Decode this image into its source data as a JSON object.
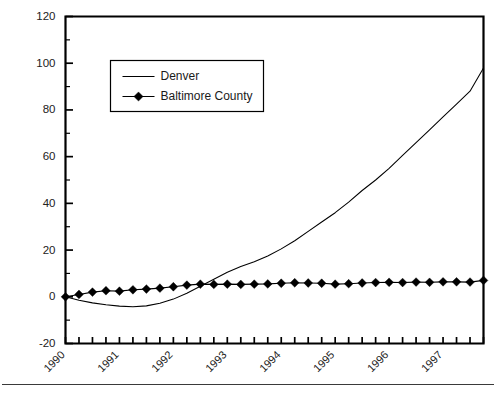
{
  "chart_data": {
    "type": "line",
    "title": "",
    "subtitle": "",
    "xlabel": "",
    "ylabel": "",
    "ylim": [
      -20,
      120
    ],
    "y_major_ticks": [
      -20,
      0,
      20,
      40,
      60,
      80,
      100,
      120
    ],
    "y_tick_labels": [
      "-20",
      "0",
      "20",
      "40",
      "60",
      "80",
      "100",
      "120"
    ],
    "y_minor_step": 10,
    "grid": false,
    "legend_position": "upper-left-inside",
    "x_axis_kind": "quarterly",
    "x_tick_count": 32,
    "x_year_labels": [
      "1990",
      "1991",
      "1992",
      "1993",
      "1994",
      "1995",
      "1996",
      "1997"
    ],
    "x": [
      "1990 Q1",
      "1990 Q2",
      "1990 Q3",
      "1990 Q4",
      "1991 Q1",
      "1991 Q2",
      "1991 Q3",
      "1991 Q4",
      "1992 Q1",
      "1992 Q2",
      "1992 Q3",
      "1992 Q4",
      "1993 Q1",
      "1993 Q2",
      "1993 Q3",
      "1993 Q4",
      "1994 Q1",
      "1994 Q2",
      "1994 Q3",
      "1994 Q4",
      "1995 Q1",
      "1995 Q2",
      "1995 Q3",
      "1995 Q4",
      "1996 Q1",
      "1996 Q2",
      "1996 Q3",
      "1996 Q4",
      "1997 Q1",
      "1997 Q2",
      "1997 Q3",
      "1997 Q4"
    ],
    "series": [
      {
        "name": "Denver",
        "marker": "none",
        "color": "#000000",
        "values": [
          0.0,
          -1.5,
          -2.6,
          -3.4,
          -4.0,
          -4.3,
          -3.9,
          -2.8,
          -1.0,
          1.5,
          4.5,
          7.5,
          10.5,
          13.0,
          15.0,
          17.5,
          20.5,
          24.0,
          28.0,
          32.0,
          36.0,
          40.5,
          45.5,
          50.0,
          55.0,
          60.5,
          66.0,
          71.5,
          77.0,
          82.5,
          88.0,
          98.0
        ]
      },
      {
        "name": "Baltimore County",
        "marker": "diamond",
        "color": "#000000",
        "values": [
          0.0,
          1.0,
          2.0,
          2.6,
          2.4,
          3.0,
          3.3,
          3.7,
          4.3,
          5.0,
          5.4,
          5.3,
          5.4,
          5.3,
          5.4,
          5.5,
          5.8,
          6.0,
          5.9,
          5.8,
          5.4,
          5.6,
          5.9,
          6.1,
          6.2,
          6.1,
          6.3,
          6.2,
          6.4,
          6.4,
          6.3,
          7.0
        ]
      }
    ]
  },
  "legend": {
    "entries": [
      {
        "label": "Denver"
      },
      {
        "label": "Baltimore County"
      }
    ]
  }
}
